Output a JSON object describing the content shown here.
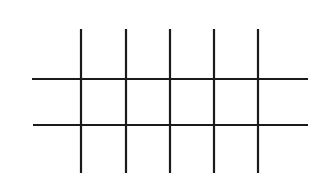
{
  "diagram": {
    "type": "grid-lines",
    "background": "#ffffff",
    "stroke_color": "#1a1a1a",
    "stroke_width": 2.2,
    "vertical_lines": [
      {
        "x": 81,
        "y1": 29,
        "y2": 173
      },
      {
        "x": 126,
        "y1": 29,
        "y2": 173
      },
      {
        "x": 170,
        "y1": 29,
        "y2": 173
      },
      {
        "x": 214,
        "y1": 29,
        "y2": 173
      },
      {
        "x": 258,
        "y1": 29,
        "y2": 173
      }
    ],
    "horizontal_lines": [
      {
        "y": 79,
        "x1": 32,
        "x2": 308
      },
      {
        "y": 125,
        "x1": 33,
        "x2": 308
      }
    ]
  }
}
